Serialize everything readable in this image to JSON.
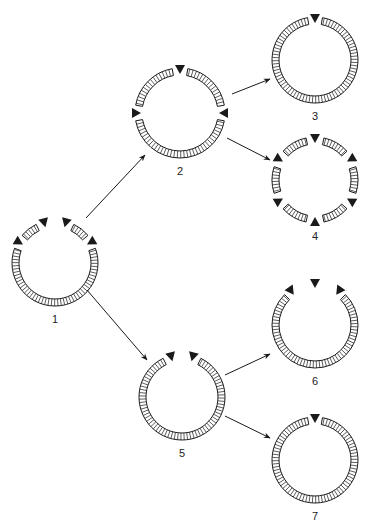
{
  "figure": {
    "width": 366,
    "height": 523,
    "colors": {
      "ink": "#1a1a1a",
      "hatch": "#333333",
      "background": "#ffffff"
    }
  },
  "nodes": [
    {
      "id": "1",
      "label": "1",
      "cx": 55,
      "cy": 263,
      "r": 40,
      "markers": [
        -150,
        -105,
        -75,
        -30
      ],
      "arcs": [
        [
          -140,
          -116
        ],
        [
          -64,
          -40
        ],
        [
          -20,
          200
        ]
      ]
    },
    {
      "id": "2",
      "label": "2",
      "cx": 180,
      "cy": 113,
      "r": 42,
      "markers": [
        -180,
        -90,
        0
      ],
      "arcs": [
        [
          -170,
          -100
        ],
        [
          -80,
          -10
        ],
        [
          10,
          170
        ]
      ]
    },
    {
      "id": "3",
      "label": "3",
      "cx": 315,
      "cy": 60,
      "r": 40,
      "markers": [
        -90
      ],
      "arcs": [
        [
          -80,
          260
        ]
      ]
    },
    {
      "id": "4",
      "label": "4",
      "cx": 315,
      "cy": 180,
      "r": 40,
      "markers": [
        -150,
        -90,
        -30,
        30,
        90,
        150
      ],
      "arcs": [
        [
          -138,
          -102
        ],
        [
          -78,
          -42
        ],
        [
          -18,
          18
        ],
        [
          42,
          78
        ],
        [
          102,
          138
        ],
        [
          162,
          198
        ]
      ]
    },
    {
      "id": "5",
      "label": "5",
      "cx": 182,
      "cy": 397,
      "r": 40,
      "markers": [
        -105,
        -75
      ],
      "arcs": [
        [
          -64,
          244
        ]
      ]
    },
    {
      "id": "6",
      "label": "6",
      "cx": 315,
      "cy": 325,
      "r": 40,
      "markers": [
        -125,
        -90,
        -55
      ],
      "arcs": [
        [
          -45,
          225
        ]
      ]
    },
    {
      "id": "7",
      "label": "7",
      "cx": 315,
      "cy": 460,
      "r": 40,
      "markers": [
        -90
      ],
      "arcs": [
        [
          -80,
          260
        ]
      ]
    }
  ],
  "edges": [
    {
      "from": "1",
      "to": "2",
      "x1": 86,
      "y1": 218,
      "x2": 145,
      "y2": 155
    },
    {
      "from": "1",
      "to": "5",
      "x1": 87,
      "y1": 290,
      "x2": 147,
      "y2": 360
    },
    {
      "from": "2",
      "to": "3",
      "x1": 232,
      "y1": 94,
      "x2": 270,
      "y2": 79
    },
    {
      "from": "2",
      "to": "4",
      "x1": 227,
      "y1": 138,
      "x2": 270,
      "y2": 160
    },
    {
      "from": "5",
      "to": "6",
      "x1": 225,
      "y1": 375,
      "x2": 270,
      "y2": 354
    },
    {
      "from": "5",
      "to": "7",
      "x1": 225,
      "y1": 416,
      "x2": 270,
      "y2": 438
    }
  ]
}
